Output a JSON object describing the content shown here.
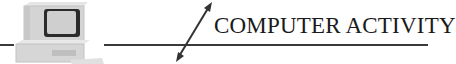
{
  "banner": {
    "title": "COMPUTER ACTIVITY",
    "icons": {
      "computer": "computer-icon",
      "arrow": "double-headed-arrow-icon"
    },
    "colors": {
      "line": "#3a3a3a",
      "text": "#1a1a1a",
      "computer_body": "#d9d9d9",
      "computer_shadow": "#bdbdbd",
      "screen_border": "#2b2b2b"
    }
  }
}
